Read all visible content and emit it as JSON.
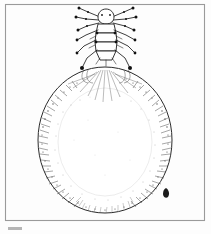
{
  "plate": {
    "kind": "scientific-illustration",
    "subject": "scale insect female with ovisac",
    "style": "pen-and-ink engraving",
    "caption": "",
    "background_color": "#fdfdfd",
    "ink_color": "#1b1b1b",
    "frame": {
      "visible": true,
      "color": "#9a9a9a",
      "x": 5,
      "y": 4,
      "width": 200,
      "height": 217
    },
    "artifact": {
      "present": true,
      "color": "#b5b5b5",
      "x": 8,
      "y": 227,
      "width": 14,
      "height": 3
    }
  },
  "figure": {
    "ovisac": {
      "label": "ovisac",
      "center_x": 105,
      "center_y": 140,
      "radius_x": 67,
      "radius_y": 73,
      "fill": "#ffffff",
      "outline_color": "#2a2a2a",
      "texture": "radial hatching with dense marginal stippling"
    },
    "insect": {
      "label": "adult female",
      "head_x": 106,
      "head_y": 16,
      "body_top": 10,
      "body_bottom": 60,
      "antennae_count": 2,
      "leg_pairs": 3,
      "segments": 5
    }
  }
}
